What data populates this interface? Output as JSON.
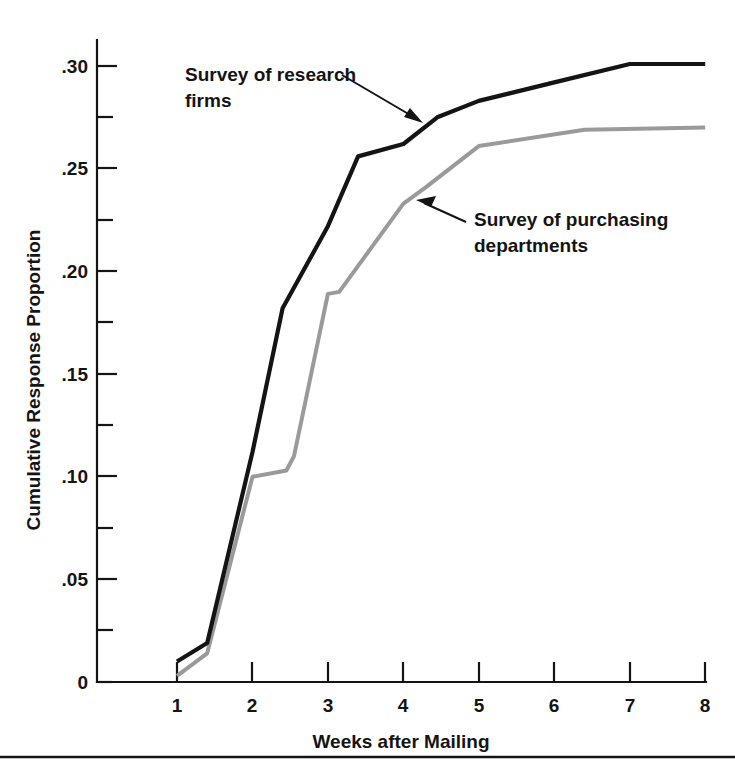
{
  "chart_data": {
    "type": "line",
    "title": "",
    "xlabel": "Weeks after Mailing",
    "ylabel": "Cumulative Response Proportion",
    "xlim": [
      0.35,
      8.0
    ],
    "ylim": [
      0,
      0.3
    ],
    "grid": false,
    "legend_position": "annotations-on-plot",
    "x_ticks": [
      "1",
      "2",
      "3",
      "4",
      "5",
      "6",
      "7",
      "8"
    ],
    "x_tick_values": [
      1,
      2,
      3,
      4,
      5,
      6,
      7,
      8
    ],
    "y_ticks": [
      "0",
      ".05",
      ".10",
      ".15",
      ".20",
      ".25",
      ".30"
    ],
    "y_tick_values": [
      0,
      0.05,
      0.1,
      0.15,
      0.2,
      0.25,
      0.3
    ],
    "y_minor_tick_values": [
      0.025,
      0.075,
      0.125,
      0.175,
      0.225,
      0.275
    ],
    "series": [
      {
        "name": "Survey of research firms",
        "color": "#141414",
        "points": [
          [
            1.0,
            0.01
          ],
          [
            1.4,
            0.019
          ],
          [
            2.0,
            0.112
          ],
          [
            2.4,
            0.182
          ],
          [
            3.0,
            0.222
          ],
          [
            3.4,
            0.256
          ],
          [
            4.0,
            0.262
          ],
          [
            4.45,
            0.275
          ],
          [
            5.0,
            0.283
          ],
          [
            6.0,
            0.292
          ],
          [
            7.0,
            0.301
          ],
          [
            8.0,
            0.301
          ]
        ]
      },
      {
        "name": "Survey of purchasing departments",
        "color": "#9a9a9a",
        "points": [
          [
            1.0,
            0.003
          ],
          [
            1.4,
            0.014
          ],
          [
            2.0,
            0.1
          ],
          [
            2.45,
            0.103
          ],
          [
            2.55,
            0.11
          ],
          [
            3.0,
            0.189
          ],
          [
            3.15,
            0.19
          ],
          [
            4.0,
            0.233
          ],
          [
            4.3,
            0.241
          ],
          [
            5.0,
            0.261
          ],
          [
            6.4,
            0.269
          ],
          [
            8.0,
            0.27
          ]
        ]
      }
    ],
    "annotations": [
      {
        "id": "annotation-research-firms",
        "lines": [
          "Survey of research",
          "firms"
        ],
        "text": "Survey of research firms",
        "points_to_series": "Survey of research firms"
      },
      {
        "id": "annotation-purchasing-departments",
        "lines": [
          "Survey of purchasing",
          "departments"
        ],
        "text": "Survey of purchasing departments",
        "points_to_series": "Survey of purchasing departments"
      }
    ]
  },
  "axes": {
    "x_title": "Weeks after Mailing",
    "y_title": "Cumulative Response Proportion",
    "x_tick_labels": [
      "1",
      "2",
      "3",
      "4",
      "5",
      "6",
      "7",
      "8"
    ],
    "y_tick_labels": [
      "0",
      ".05",
      ".10",
      ".15",
      ".20",
      ".25",
      ".30"
    ]
  },
  "annotations": {
    "research_firms_line1": "Survey of research",
    "research_firms_line2": "firms",
    "purchasing_line1": "Survey of purchasing",
    "purchasing_line2": "departments"
  },
  "colors": {
    "series_research_firms": "#141414",
    "series_purchasing_departments": "#9a9a9a",
    "axis": "#141414",
    "background": "#ffffff"
  }
}
